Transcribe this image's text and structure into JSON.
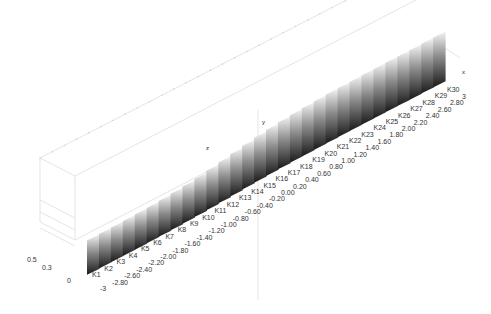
{
  "chart_data": {
    "type": "area",
    "subtype": "3d-ribbon",
    "title": "",
    "categories": [
      "K1",
      "K2",
      "K3",
      "K4",
      "K5",
      "K6",
      "K7",
      "K8",
      "K9",
      "K10",
      "K11",
      "K12",
      "K13",
      "K14",
      "K15",
      "K16",
      "K17",
      "K18",
      "K19",
      "K20",
      "K21",
      "K22",
      "K23",
      "K24",
      "K25",
      "K26",
      "K27",
      "K28",
      "K29",
      "K30"
    ],
    "x_ticks": [
      "-3",
      "-2.80",
      "-2.60",
      "-2.40",
      "-2.20",
      "-2.00",
      "-1.80",
      "-1.60",
      "-1.40",
      "-1.20",
      "-1.00",
      "-0.80",
      "-0.60",
      "-0.40",
      "-0.20",
      "0.00",
      "0.20",
      "0.40",
      "0.60",
      "0.80",
      "1.00",
      "1.20",
      "1.40",
      "1.60",
      "1.80",
      "2.00",
      "2.20",
      "2.40",
      "2.60",
      "2.80",
      "3"
    ],
    "z_ticks": [
      "0",
      "0.3",
      "0.5"
    ],
    "axis_labels": {
      "x": "x",
      "y": "y",
      "z": "z"
    },
    "series": [
      {
        "name": "profile",
        "values": [
          0.02,
          0.03,
          0.04,
          0.05,
          0.07,
          0.09,
          0.12,
          0.16,
          0.21,
          0.27,
          0.35,
          0.44,
          0.53,
          0.62,
          0.7,
          0.77,
          0.83,
          0.87,
          0.9,
          0.93,
          0.95,
          0.96,
          0.97,
          0.98,
          0.98,
          0.99,
          0.99,
          0.99,
          1.0,
          1.0
        ]
      }
    ],
    "grid": true,
    "legend": "none",
    "colormap": "gray"
  }
}
